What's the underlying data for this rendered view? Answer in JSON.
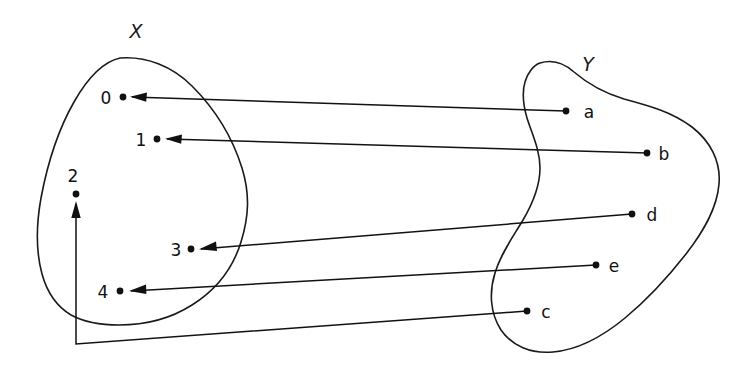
{
  "diagram": {
    "kind": "set-mapping-diagram",
    "background_color": "#ffffff",
    "ink_color": "#111111",
    "width": 748,
    "height": 374,
    "sets": [
      {
        "id": "X",
        "title": "X",
        "title_x": 136,
        "title_y": 38,
        "elements": [
          {
            "id": "x0",
            "label": "0",
            "label_x": 106,
            "label_y": 104,
            "dot_x": 123,
            "dot_y": 97
          },
          {
            "id": "x1",
            "label": "1",
            "label_x": 141,
            "label_y": 146,
            "dot_x": 157,
            "dot_y": 139
          },
          {
            "id": "x2",
            "label": "2",
            "label_x": 69,
            "label_y": 182,
            "dot_x": 76,
            "dot_y": 194
          },
          {
            "id": "x3",
            "label": "3",
            "label_x": 174,
            "label_y": 256,
            "dot_x": 191,
            "dot_y": 249
          },
          {
            "id": "x4",
            "label": "4",
            "label_x": 100,
            "label_y": 298,
            "dot_x": 120,
            "dot_y": 291
          }
        ]
      },
      {
        "id": "Y",
        "title": "Y",
        "title_x": 588,
        "title_y": 71,
        "elements": [
          {
            "id": "ya",
            "label": "a",
            "label_x": 583,
            "label_y": 118,
            "dot_x": 566,
            "dot_y": 111
          },
          {
            "id": "yb",
            "label": "b",
            "label_x": 660,
            "label_y": 160,
            "dot_x": 647,
            "dot_y": 153
          },
          {
            "id": "yd",
            "label": "d",
            "label_x": 648,
            "label_y": 221,
            "dot_x": 632,
            "dot_y": 214
          },
          {
            "id": "ye",
            "label": "e",
            "label_x": 610,
            "label_y": 272,
            "dot_x": 596,
            "dot_y": 265
          },
          {
            "id": "yc",
            "label": "c",
            "label_x": 542,
            "label_y": 318,
            "dot_x": 527,
            "dot_y": 311
          }
        ]
      }
    ],
    "mappings": [
      {
        "id": "map-a-to-0",
        "from": "a",
        "to": "0",
        "from_x": 566,
        "from_y": 111,
        "to_x": 130,
        "to_y": 97
      },
      {
        "id": "map-b-to-1",
        "from": "b",
        "to": "1",
        "from_x": 647,
        "from_y": 153,
        "to_x": 165,
        "to_y": 139
      },
      {
        "id": "map-d-to-3",
        "from": "d",
        "to": "3",
        "from_x": 632,
        "from_y": 214,
        "to_x": 199,
        "to_y": 249
      },
      {
        "id": "map-e-to-4",
        "from": "e",
        "to": "4",
        "from_x": 596,
        "from_y": 265,
        "to_x": 129,
        "to_y": 291
      },
      {
        "id": "map-c-to-2",
        "from": "c",
        "to": "2",
        "from_x": 527,
        "from_y": 311,
        "to_x": 76,
        "to_y": 202
      }
    ],
    "notes": {
      "relation_text": "Arrows run from elements of Y to elements of X",
      "x_blob_shape": "closed rounded blob, tallest near top-left",
      "y_blob_shape": "kidney / bean shape with concave left edge"
    }
  }
}
